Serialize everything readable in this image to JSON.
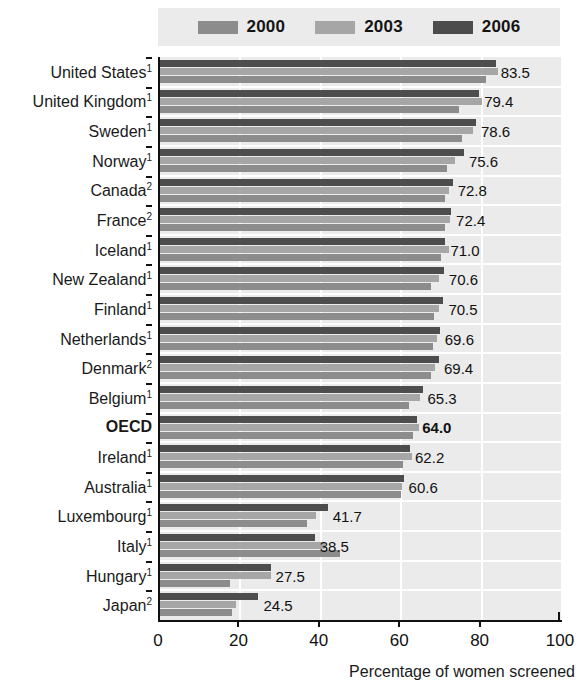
{
  "chart_data": {
    "type": "bar",
    "orientation": "horizontal",
    "title": "",
    "xlabel": "Percentage of women screened",
    "ylabel": "",
    "xlim": [
      0,
      100
    ],
    "xticks": [
      0,
      20,
      40,
      60,
      80,
      100
    ],
    "grid": true,
    "legend_position": "top",
    "categories": [
      "United States",
      "United Kingdom",
      "Sweden",
      "Norway",
      "Canada",
      "France",
      "Iceland",
      "New Zealand",
      "Finland",
      "Netherlands",
      "Denmark",
      "Belgium",
      "OECD",
      "Ireland",
      "Australia",
      "Luxembourg",
      "Italy",
      "Hungary",
      "Japan"
    ],
    "category_footnotes": [
      "1",
      "1",
      "1",
      "1",
      "2",
      "2",
      "1",
      "1",
      "1",
      "1",
      "2",
      "1",
      "",
      "1",
      "1",
      "1",
      "1",
      "1",
      "2"
    ],
    "highlight_category": "OECD",
    "series": [
      {
        "name": "2000",
        "color": "#8c8c8c",
        "values": [
          81.0,
          74.5,
          75.2,
          71.5,
          70.8,
          71.0,
          69.8,
          67.5,
          68.2,
          68.0,
          67.5,
          62.0,
          63.0,
          60.5,
          60.0,
          36.5,
          44.8,
          17.5,
          18.0
        ]
      },
      {
        "name": "2003",
        "color": "#a6a6a6",
        "values": [
          84.0,
          80.2,
          77.8,
          73.5,
          72.0,
          72.2,
          71.8,
          69.5,
          69.5,
          69.0,
          68.5,
          64.8,
          64.5,
          62.8,
          60.2,
          38.8,
          41.0,
          27.5,
          19.0
        ]
      },
      {
        "name": "2006",
        "color": "#4d4d4d",
        "values": [
          83.5,
          79.4,
          78.6,
          75.6,
          72.8,
          72.4,
          71.0,
          70.6,
          70.5,
          69.6,
          69.4,
          65.3,
          64.0,
          62.2,
          60.6,
          41.7,
          38.5,
          27.5,
          24.5
        ]
      }
    ],
    "value_labels": [
      "83.5",
      "79.4",
      "78.6",
      "75.6",
      "72.8",
      "72.4",
      "71.0",
      "70.6",
      "70.5",
      "69.6",
      "69.4",
      "65.3",
      "64.0",
      "62.2",
      "60.6",
      "41.7",
      "38.5",
      "27.5",
      "24.5"
    ]
  },
  "legend": {
    "items": [
      {
        "label": "2000",
        "color": "#8c8c8c"
      },
      {
        "label": "2003",
        "color": "#a6a6a6"
      },
      {
        "label": "2006",
        "color": "#4d4d4d"
      }
    ]
  },
  "colors": {
    "plot_background": "#ebebeb",
    "gridline": "#ffffff",
    "axis": "#111111",
    "text": "#1a1a1a"
  }
}
